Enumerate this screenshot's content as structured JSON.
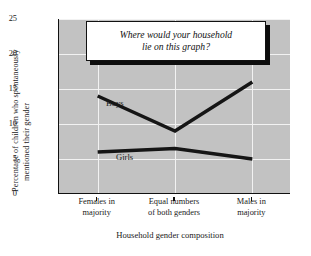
{
  "chart_data": {
    "type": "line",
    "title": "",
    "xlabel": "Household gender composition",
    "ylabel": "Percentage of children who spontaneously mentioned their gender",
    "ylabel_lines": [
      "Percentage of children who spontaneously",
      "mentioned their gender"
    ],
    "categories": [
      "Females in majority",
      "Equal numbers of both genders",
      "Males in majority"
    ],
    "category_lines": [
      [
        "Females in",
        "majority"
      ],
      [
        "Equal numbers",
        "of both genders"
      ],
      [
        "Males in",
        "majority"
      ]
    ],
    "series": [
      {
        "name": "Boys",
        "values": [
          14,
          9,
          16
        ]
      },
      {
        "name": "Girls",
        "values": [
          6,
          6.5,
          5
        ]
      }
    ],
    "ylim": [
      0,
      25
    ],
    "yticks": [
      0,
      5,
      10,
      15,
      20,
      25
    ],
    "ytick_labels": [
      "0",
      "5",
      "10",
      "15",
      "20",
      "25"
    ],
    "grid": true,
    "legend": "inline-labels",
    "annotations": [
      {
        "name": "callout",
        "lines": [
          "Where would your household",
          "lie on this graph?"
        ],
        "style": "italic-box-with-shadow"
      }
    ],
    "colors": {
      "plot_background": "#c2c2c2",
      "gridline": "#f2f2f2",
      "line": "#151515",
      "axis": "#111111",
      "figure_background": "#ffffff",
      "callout_background": "#ffffff",
      "callout_shadow": "#0d0d0d"
    }
  }
}
